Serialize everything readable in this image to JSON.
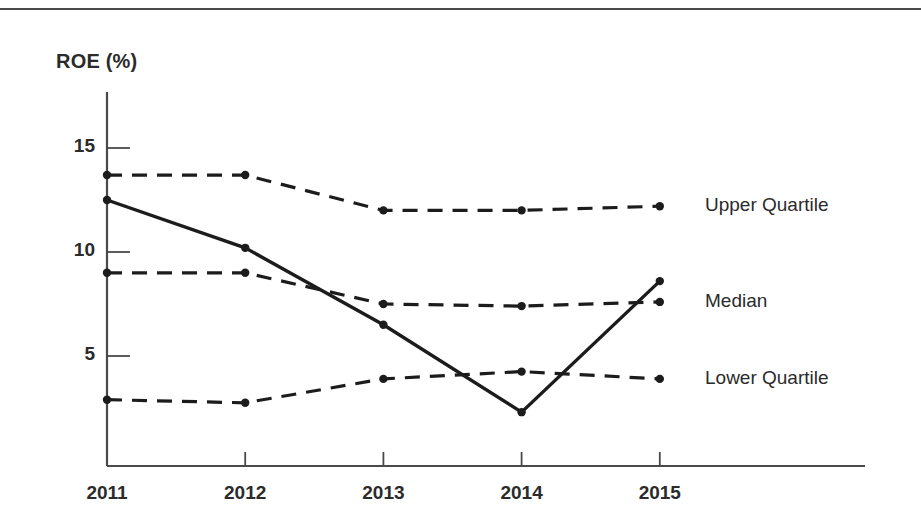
{
  "figure": {
    "axis_title": "ROE (%)",
    "ink_color": "#1c1c1c",
    "rule_color": "#4a4a4a",
    "background": "#ffffff"
  },
  "chart_data": {
    "type": "line",
    "title": "",
    "subtitle": "",
    "xlabel": "",
    "ylabel": "ROE (%)",
    "x": [
      2011,
      2012,
      2013,
      2014,
      2015
    ],
    "categories": [
      "2011",
      "2012",
      "2013",
      "2014",
      "2015"
    ],
    "xtick_labels": [
      "2011",
      "2012",
      "2013",
      "2014",
      "2015"
    ],
    "ytick_labels": [
      "15",
      "10",
      "5"
    ],
    "yticks": [
      15,
      10,
      5
    ],
    "ylim": [
      0,
      17.4
    ],
    "xlim": [
      2010.75,
      2015.3
    ],
    "grid": false,
    "legend_position": "right-of-plot-inline",
    "series": [
      {
        "name": "Upper Quartile",
        "label": "Upper Quartile",
        "style": "dashed",
        "markers": true,
        "values": [
          13.7,
          13.7,
          12.0,
          12.0,
          12.2
        ]
      },
      {
        "name": "Company",
        "label": "",
        "style": "solid",
        "markers": true,
        "values": [
          12.5,
          10.2,
          6.5,
          2.3,
          8.6
        ]
      },
      {
        "name": "Median",
        "label": "Median",
        "style": "dashed",
        "markers": true,
        "values": [
          9.0,
          9.0,
          7.5,
          7.4,
          7.6
        ]
      },
      {
        "name": "Lower Quartile",
        "label": "Lower Quartile",
        "style": "dashed",
        "markers": true,
        "values": [
          2.9,
          2.75,
          3.9,
          4.25,
          3.9
        ]
      }
    ]
  }
}
